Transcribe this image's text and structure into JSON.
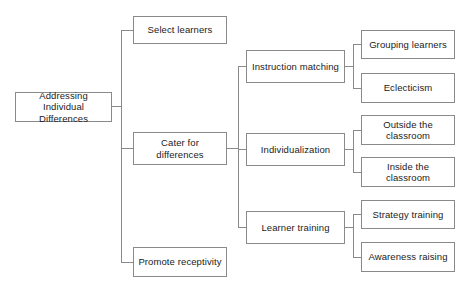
{
  "diagram": {
    "background_color": "#ffffff",
    "box_border_color": "#8a8a8a",
    "connector_color": "#8a8a8a",
    "text_color": "#1b1b1b",
    "levels": [
      {
        "level": 1,
        "nodes": [
          {
            "id": "root",
            "label": "Addressing Individual\nDifferences"
          }
        ]
      },
      {
        "level": 2,
        "nodes": [
          {
            "id": "select-learners",
            "label": "Select learners"
          },
          {
            "id": "cater-for-differences",
            "label": "Cater for differences"
          },
          {
            "id": "promote-receptivity",
            "label": "Promote receptivity"
          }
        ]
      },
      {
        "level": 3,
        "nodes": [
          {
            "id": "instruction-matching",
            "label": "Instruction matching"
          },
          {
            "id": "individualization",
            "label": "Individualization"
          },
          {
            "id": "learner-training",
            "label": "Learner training"
          }
        ]
      },
      {
        "level": 4,
        "nodes": [
          {
            "id": "grouping-learners",
            "label": "Grouping learners"
          },
          {
            "id": "eclecticism",
            "label": "Eclecticism"
          },
          {
            "id": "outside-the-classroom",
            "label": "Outside the\nclassroom"
          },
          {
            "id": "inside-the-classroom",
            "label": "Inside the\nclassroom"
          },
          {
            "id": "strategy-training",
            "label": "Strategy training"
          },
          {
            "id": "awareness-raising",
            "label": "Awareness raising"
          }
        ]
      }
    ]
  }
}
